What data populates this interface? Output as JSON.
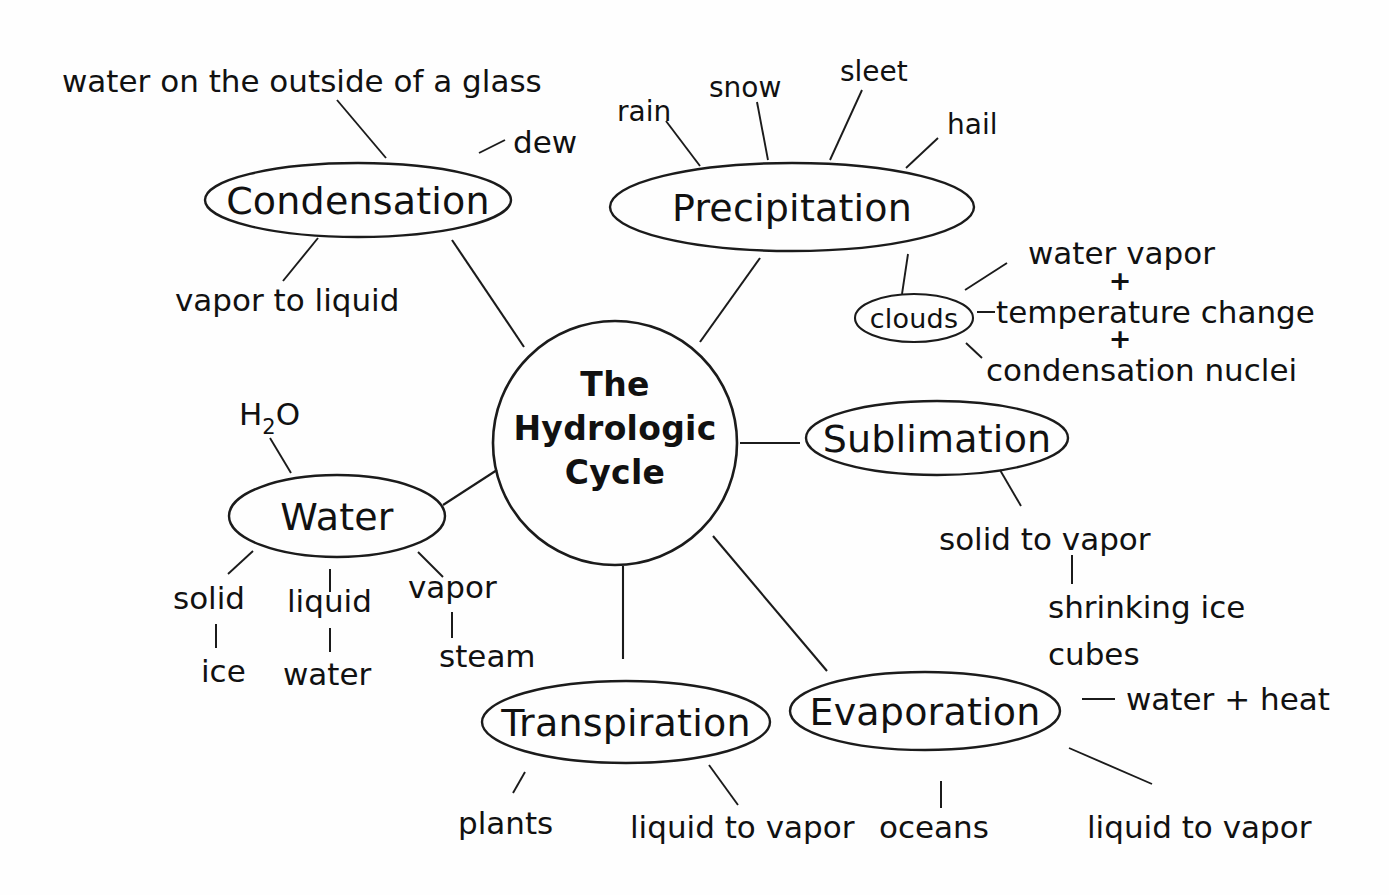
{
  "diagram": {
    "title": "The Hydrologic Cycle",
    "background_color": "#fefefe",
    "ink_color": "#111111",
    "center": {
      "line1": "The",
      "line2": "Hydrologic",
      "line3": "Cycle"
    },
    "nodes": {
      "condensation": "Condensation",
      "precipitation": "Precipitation",
      "clouds": "clouds",
      "sublimation": "Sublimation",
      "water": "Water",
      "transpiration": "Transpiration",
      "evaporation": "Evaporation"
    },
    "labels": {
      "water_on_glass": "water on the outside of a glass",
      "dew": "dew",
      "vapor_to_liquid": "vapor to liquid",
      "rain": "rain",
      "snow": "snow",
      "sleet": "sleet",
      "hail": "hail",
      "water_vapor": "water vapor",
      "plus_one": "+",
      "temperature_change": "temperature change",
      "plus_two": "+",
      "condensation_nuclei": "condensation nuclei",
      "h2o_formula": "H",
      "h2o_subscript": "2",
      "h2o_oxygen": "O",
      "solid": "solid",
      "liquid": "liquid",
      "vapor": "vapor",
      "ice": "ice",
      "water_state": "water",
      "steam": "steam",
      "solid_to_vapor": "solid to vapor",
      "shrinking_ice": "shrinking ice",
      "cubes": "cubes",
      "water_plus_heat": "water + heat",
      "liquid_to_vapor_evap": "liquid to vapor",
      "plants": "plants",
      "liquid_to_vapor_trans": "liquid to vapor",
      "oceans": "oceans"
    }
  }
}
